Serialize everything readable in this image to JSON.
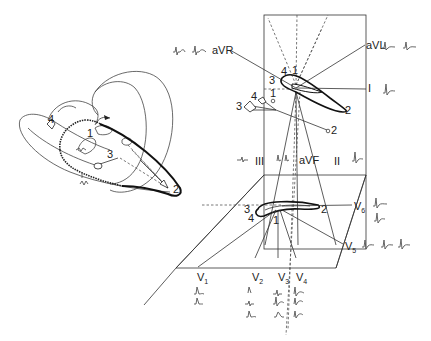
{
  "diagram": {
    "type": "vectorcardiogram-projection",
    "heart": {
      "labels": [
        "1",
        "2",
        "3",
        "4"
      ],
      "note": "3D heart with QRS vector loop and activation vectors"
    },
    "frontal_plane": {
      "leads": {
        "aVR": "aVR",
        "aVL": "aVL",
        "I": "I",
        "II": "II",
        "III": "III",
        "aVF": "aVF"
      },
      "loop_labels": [
        "1",
        "2",
        "3",
        "4"
      ],
      "vector_labels": [
        "1",
        "2",
        "3",
        "4"
      ]
    },
    "horizontal_plane": {
      "leads": {
        "V1": "V",
        "V1_sub": "1",
        "V2": "V",
        "V2_sub": "2",
        "V3": "V",
        "V3_sub": "3",
        "V4": "V",
        "V4_sub": "4",
        "V5": "V",
        "V5_sub": "5",
        "V6": "V",
        "V6_sub": "6"
      },
      "loop_labels": [
        "1",
        "2",
        "3",
        "4"
      ]
    }
  }
}
